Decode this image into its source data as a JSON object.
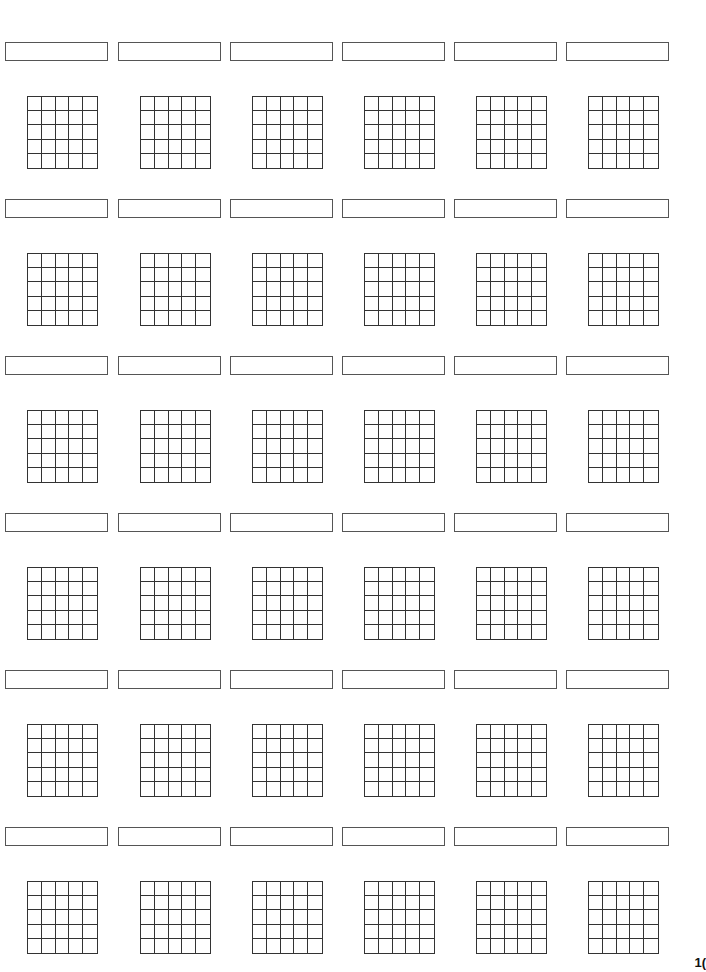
{
  "page": {
    "type": "blank-grid-worksheet",
    "rows": 6,
    "columns": 6,
    "grid_size": {
      "rows": 5,
      "cols": 5
    },
    "line_color": "#333333",
    "page_number": "1("
  },
  "layout": {
    "column_x": [
      5,
      118,
      230,
      342,
      454,
      566
    ],
    "row_box_y": [
      42,
      199,
      356,
      513,
      670,
      827
    ],
    "grid_offset_x": 22,
    "grid_offset_y": 54
  },
  "cells": [
    {
      "label": ""
    },
    {
      "label": ""
    },
    {
      "label": ""
    },
    {
      "label": ""
    },
    {
      "label": ""
    },
    {
      "label": ""
    },
    {
      "label": ""
    },
    {
      "label": ""
    },
    {
      "label": ""
    },
    {
      "label": ""
    },
    {
      "label": ""
    },
    {
      "label": ""
    },
    {
      "label": ""
    },
    {
      "label": ""
    },
    {
      "label": ""
    },
    {
      "label": ""
    },
    {
      "label": ""
    },
    {
      "label": ""
    },
    {
      "label": ""
    },
    {
      "label": ""
    },
    {
      "label": ""
    },
    {
      "label": ""
    },
    {
      "label": ""
    },
    {
      "label": ""
    },
    {
      "label": ""
    },
    {
      "label": ""
    },
    {
      "label": ""
    },
    {
      "label": ""
    },
    {
      "label": ""
    },
    {
      "label": ""
    },
    {
      "label": ""
    },
    {
      "label": ""
    },
    {
      "label": ""
    },
    {
      "label": ""
    },
    {
      "label": ""
    },
    {
      "label": ""
    }
  ]
}
